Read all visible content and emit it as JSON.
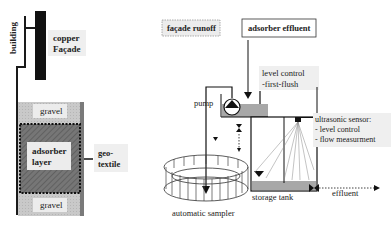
{
  "left_panel": {
    "building_label": "building",
    "copper_facade_label": [
      "copper",
      "Façade"
    ],
    "gravel_top_label": "gravel",
    "adsorber_layer_label": [
      "adsorber",
      "layer"
    ],
    "geotextile_label": [
      "geo-",
      "textile"
    ],
    "gravel_bottom_label": "gravel"
  },
  "right_panel": {
    "facade_runoff_label": "façade runoff",
    "adsorber_effluent_label": "adsorber effluent",
    "level_control_label": [
      "level control",
      "-first-flush"
    ],
    "pump_label": "pump",
    "ultrasonic_sensor_label": [
      "ultrasonic sensor:",
      "- level control",
      "- flow measurment"
    ],
    "automatic_sampler_label": "automatic sampler",
    "storage_tank_label": "storage tank",
    "effluent_label": "effluent"
  },
  "colors": {
    "line": "#1a1a1a",
    "gravel": "#c8c8c8",
    "adsorber": "#6e6e6e",
    "geotextile_side": "#7a7a7a",
    "label_bg": "#ececec",
    "tank_fill": "#a8a8a8"
  }
}
